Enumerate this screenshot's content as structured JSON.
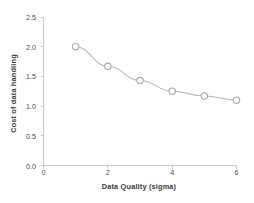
{
  "chart_data": {
    "type": "line",
    "title": "",
    "subtitle": "",
    "xlabel": "Data Quality (sigma)",
    "ylabel": "Cost of data handling",
    "x": [
      1,
      2,
      3,
      4,
      5,
      6
    ],
    "values": [
      2.0,
      1.67,
      1.43,
      1.25,
      1.17,
      1.1
    ],
    "series": [
      {
        "name": "Cost of data handling",
        "values": [
          2.0,
          1.67,
          1.43,
          1.25,
          1.17,
          1.1
        ]
      }
    ],
    "xlim": [
      0,
      6
    ],
    "ylim": [
      0.0,
      2.5
    ],
    "x_ticks": [
      0,
      2,
      4,
      6
    ],
    "x_tick_labels": [
      "0",
      "2",
      "4",
      "6"
    ],
    "y_ticks": [
      0.0,
      0.5,
      1.0,
      1.5,
      2.0,
      2.5
    ],
    "y_tick_labels": [
      "0.0",
      "0.5",
      "1.0",
      "1.5",
      "2.0",
      "2.5"
    ],
    "grid": false,
    "legend": false,
    "legend_position": "none",
    "marker": "open-circle",
    "colors": {
      "line": "#b9b9b9",
      "marker_edge": "#a8a8a8",
      "marker_fill": "#ffffff",
      "axis": "#c9c9c9",
      "text": "#3f3f3f",
      "background": "#ffffff"
    }
  },
  "axes": {
    "x_title": "Data Quality (sigma)",
    "y_title": "Cost of data handling"
  },
  "ticks": {
    "x": [
      "0",
      "2",
      "4",
      "6"
    ],
    "y": [
      "0.0",
      "0.5",
      "1.0",
      "1.5",
      "2.0",
      "2.5"
    ]
  }
}
